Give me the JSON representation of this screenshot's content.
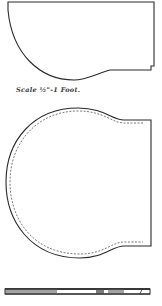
{
  "figure": {
    "caption": "Scale ½\"-1 Foot.",
    "colors": {
      "line": "#2a2a2a",
      "dashed": "#555555",
      "paper": "#ffffff"
    },
    "pieces": [
      {
        "name": "top-pattern",
        "outline": "solid"
      },
      {
        "name": "middle-pattern",
        "outline": "solid-with-dashed-inner-seam"
      },
      {
        "name": "bottom-strip",
        "outline": "side-view-bar"
      }
    ],
    "strip_text": "IIIIIIIIIIII  III IIIII"
  }
}
